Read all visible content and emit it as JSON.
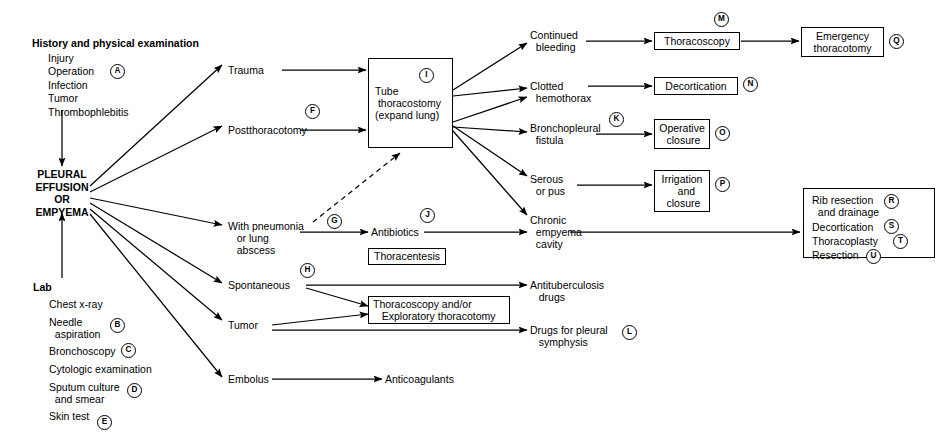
{
  "assessment": {
    "history_header": "History and physical examination",
    "history_items": "Injury\nOperation\nInfection\nTumor\nThrombophlebitis",
    "history_marker": "A",
    "lab_header": "Lab",
    "lab_items": [
      {
        "label": "Chest x-ray",
        "marker": ""
      },
      {
        "label": "Needle\n  aspiration",
        "marker": "B"
      },
      {
        "label": "Bronchoscopy",
        "marker": "C"
      },
      {
        "label": "Cytologic examination",
        "marker": ""
      },
      {
        "label": "Sputum culture\n  and smear",
        "marker": "D"
      },
      {
        "label": "Skin test",
        "marker": "E"
      }
    ]
  },
  "hub": {
    "label": "PLEURAL\nEFFUSION\nOR\nEMPYEMA"
  },
  "causes": [
    {
      "label": "Trauma",
      "marker": ""
    },
    {
      "label": "Postthoracotomy",
      "marker": "F"
    },
    {
      "label": "With pneumonia\n   or lung\n   abscess",
      "marker": "G"
    },
    {
      "label": "Spontaneous",
      "marker": "H"
    },
    {
      "label": "Tumor",
      "marker": ""
    },
    {
      "label": "Embolus",
      "marker": ""
    }
  ],
  "treatment_boxes": {
    "tube_thoracostomy": {
      "label": "Tube\n thoracostomy\n(expand lung)",
      "marker": "I"
    },
    "thoracentesis": {
      "label": "Thoracentesis"
    },
    "thoracoscopy_exploratory": {
      "label": "Thoracoscopy and/or\n   Exploratory thoracotomy"
    },
    "thoracoscopy": {
      "label": "Thoracoscopy",
      "marker": "M"
    },
    "decortication": {
      "label": "Decortication",
      "marker": "N"
    },
    "operative_closure": {
      "label": "Operative\n closure",
      "marker": "O"
    },
    "irrigation_closure": {
      "label": "Irrigation\n   and\n closure",
      "marker": "P"
    },
    "emergency_thoracotomy": {
      "label": "Emergency\nthoracotomy",
      "marker": "Q"
    }
  },
  "outcomes": [
    {
      "label": "Continued\n  bleeding",
      "marker": ""
    },
    {
      "label": "Clotted\n  hemothorax",
      "marker": ""
    },
    {
      "label": "Bronchopleural\n  fistula",
      "marker": "K"
    },
    {
      "label": "Serous\n  or pus",
      "marker": ""
    },
    {
      "label": "Chronic\n  empyema\n  cavity",
      "marker": ""
    }
  ],
  "medications": {
    "antibiotics": {
      "label": "Antibiotics",
      "marker": "J"
    },
    "antituberculosis": {
      "label": "Antituberculosis\n   drugs",
      "marker": ""
    },
    "pleural_symphysis": {
      "label": "Drugs for pleural\n   symphysis",
      "marker": "L"
    },
    "anticoagulants": {
      "label": "Anticoagulants",
      "marker": ""
    }
  },
  "chronic_empyema_box": {
    "items": [
      {
        "label": "Rib resection\n  and drainage",
        "marker": "R"
      },
      {
        "label": "Decortication",
        "marker": "S"
      },
      {
        "label": "Thoracoplasty",
        "marker": "T"
      },
      {
        "label": "Resection",
        "marker": "U"
      }
    ]
  },
  "colors": {
    "line": "#000000",
    "background": "#ffffff"
  }
}
